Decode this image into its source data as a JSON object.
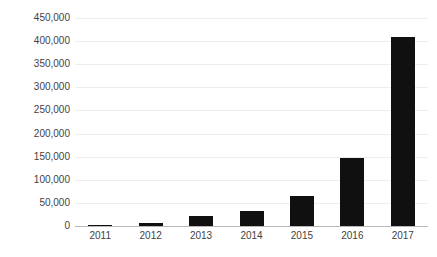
{
  "chart_data": {
    "type": "bar",
    "title": "",
    "subtitle": "",
    "xlabel": "",
    "ylabel": "",
    "categories": [
      "2011",
      "2012",
      "2013",
      "2014",
      "2015",
      "2016",
      "2017"
    ],
    "values": [
      2000,
      6000,
      21000,
      32000,
      65000,
      148000,
      408000
    ],
    "series": [
      {
        "name": "",
        "values": [
          2000,
          6000,
          21000,
          32000,
          65000,
          148000,
          408000
        ]
      }
    ],
    "ylim": [
      0,
      450000
    ],
    "ytick_step": 50000,
    "ytick_labels": [
      "450,000",
      "400,000",
      "350,000",
      "300,000",
      "250,000",
      "200,000",
      "150,000",
      "100,000",
      "50,000",
      "0"
    ],
    "ytick_values": [
      450000,
      400000,
      350000,
      300000,
      250000,
      200000,
      150000,
      100000,
      50000,
      0
    ],
    "grid": true,
    "grid_axis": "y",
    "legend": false,
    "legend_position": "none",
    "annotations": []
  },
  "style": {
    "bar_color": "#101010",
    "grid_color": "#ededed",
    "baseline_color": "#b8b8b8",
    "label_color": "#3f3f3f",
    "background_color": "#ffffff"
  }
}
